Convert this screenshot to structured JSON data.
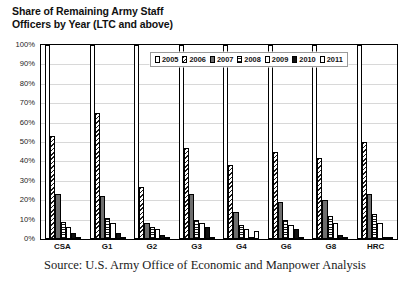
{
  "chart_data": {
    "type": "bar",
    "title": "Share of Remaining Army Staff Officers by Year (LTC and above)",
    "title_line1": "Share of Remaining Army Staff",
    "title_line2": "Officers by Year (LTC and above)",
    "xlabel": "",
    "ylabel": "",
    "ylim": [
      0,
      100
    ],
    "ytick_labels": [
      "100%",
      "90%",
      "80%",
      "70%",
      "60%",
      "50%",
      "40%",
      "30%",
      "20%",
      "10%",
      "0%"
    ],
    "ytick_values": [
      100,
      90,
      80,
      70,
      60,
      50,
      40,
      30,
      20,
      10,
      0
    ],
    "grid": true,
    "legend_position": "top-right-inside",
    "categories": [
      "CSA",
      "G1",
      "G2",
      "G3",
      "G4",
      "G6",
      "G8",
      "HRC"
    ],
    "series": [
      {
        "name": "2005",
        "pattern": "dotted-stipple",
        "values": [
          100,
          100,
          100,
          100,
          100,
          100,
          100,
          100
        ]
      },
      {
        "name": "2006",
        "pattern": "diagonal-hatch",
        "values": [
          53,
          65,
          27,
          47,
          38,
          45,
          42,
          50
        ]
      },
      {
        "name": "2007",
        "pattern": "solid-gray",
        "values": [
          23,
          22,
          8,
          23,
          14,
          19,
          20,
          23
        ]
      },
      {
        "name": "2008",
        "pattern": "horizontal-lines",
        "values": [
          9,
          11,
          6,
          10,
          7,
          10,
          12,
          13
        ]
      },
      {
        "name": "2009",
        "pattern": "white",
        "values": [
          6,
          8,
          5,
          8,
          5,
          7,
          8,
          8
        ]
      },
      {
        "name": "2010",
        "pattern": "solid-black",
        "values": [
          3,
          3,
          2,
          6,
          1,
          5,
          2,
          1
        ]
      },
      {
        "name": "2011",
        "pattern": "white-outline",
        "values": [
          1,
          1,
          1,
          1,
          4,
          1,
          1,
          1
        ]
      }
    ]
  },
  "source": {
    "text": "Source: U.S. Army Office of Economic and Manpower Analysis"
  }
}
